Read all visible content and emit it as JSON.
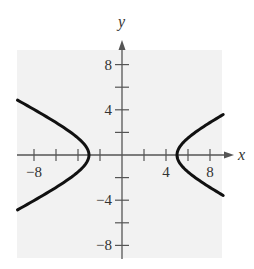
{
  "chart_data": {
    "type": "line",
    "title": "",
    "xlabel": "x",
    "ylabel": "y",
    "xlim": [
      -9.5,
      9.2
    ],
    "ylim": [
      -9.2,
      9.5
    ],
    "grid": false,
    "background": "#f2f2f2",
    "x_ticks": [
      -8,
      -6,
      -4,
      -2,
      2,
      4,
      6,
      8
    ],
    "y_ticks": [
      -8,
      -6,
      -4,
      -2,
      2,
      4,
      6,
      8
    ],
    "x_tick_labels": [
      {
        "value": -8,
        "label": "−8"
      },
      {
        "value": 4,
        "label": "4"
      },
      {
        "value": 8,
        "label": "8"
      }
    ],
    "y_tick_labels": [
      {
        "value": 8,
        "label": "8"
      },
      {
        "value": 4,
        "label": "4"
      },
      {
        "value": -4,
        "label": "−4"
      },
      {
        "value": -8,
        "label": "−8"
      }
    ],
    "curve": {
      "description": "hyperbola opening left and right",
      "equation": "(x-1)^2/16 - y^2/4 = 1",
      "center": [
        1,
        0
      ],
      "vertices": [
        [
          -3,
          0
        ],
        [
          5,
          0
        ]
      ],
      "branches": [
        {
          "name": "left",
          "x_range": [
            -9.5,
            -3
          ],
          "endpoints": [
            [
              -9.5,
              4.9
            ],
            [
              -3,
              0
            ],
            [
              -9.5,
              -4.9
            ]
          ]
        },
        {
          "name": "right",
          "x_range": [
            5,
            9.2
          ],
          "endpoints": [
            [
              9.2,
              3.6
            ],
            [
              5,
              0
            ],
            [
              9.2,
              -3.6
            ]
          ]
        }
      ],
      "color": "#111111"
    }
  }
}
